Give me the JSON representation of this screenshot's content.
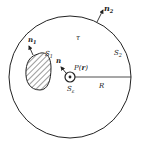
{
  "diagram": {
    "labels": {
      "n2": "n",
      "n2_sub": "2",
      "n1": "n",
      "n1_sub": "1",
      "S1": "S",
      "S1_sub": "1",
      "tau": "τ",
      "S2": "S",
      "S2_sub": "2",
      "n": "n",
      "P": "P(",
      "r": "r",
      "P_close": ")",
      "Se": "S",
      "Se_sub": "ε",
      "R": "R"
    },
    "colors": {
      "stroke": "#222222",
      "background": "#ffffff"
    }
  }
}
